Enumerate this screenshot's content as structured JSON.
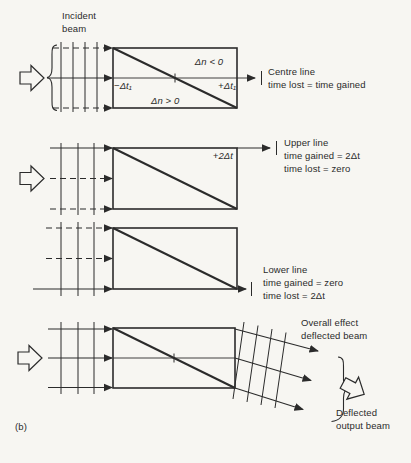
{
  "colors": {
    "ink": "#2b2b2b",
    "paper": "#f7f6f2"
  },
  "figure_label": "(b)",
  "panel_centre": {
    "incident": [
      "Incident",
      "beam"
    ],
    "region_top": "Δn < 0",
    "region_bottom": "Δn > 0",
    "time_left": "−Δt₁",
    "time_right": "+Δt₁",
    "note": [
      "Centre line",
      "time lost = time gained"
    ]
  },
  "panel_upper": {
    "time_label": "+2Δt",
    "note": [
      "Upper line",
      "time gained = 2Δt",
      "time lost = zero"
    ]
  },
  "panel_lower": {
    "note": [
      "Lower line",
      "time gained = zero",
      "time lost = 2Δt"
    ]
  },
  "panel_overall": {
    "note_top": [
      "Overall effect",
      "deflected beam"
    ],
    "note_bottom": [
      "Deflected",
      "output beam"
    ]
  }
}
